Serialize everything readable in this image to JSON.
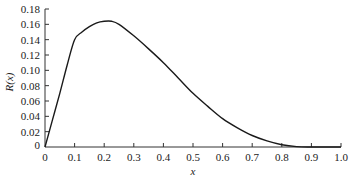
{
  "chart_data": {
    "type": "line",
    "title": "",
    "xlabel": "x",
    "ylabel": "R(x)",
    "xlim": [
      0,
      1.0
    ],
    "ylim": [
      0,
      0.18
    ],
    "grid": false,
    "legend": null,
    "x_ticks": [
      "0",
      "0.1",
      "0.2",
      "0.3",
      "0.4",
      "0.5",
      "0.6",
      "0.7",
      "0.8",
      "0.9",
      "1.0"
    ],
    "y_ticks": [
      "0",
      "0.02",
      "0.04",
      "0.06",
      "0.08",
      "0.10",
      "0.12",
      "0.14",
      "0.16",
      "0.18"
    ],
    "series": [
      {
        "name": "R(x)",
        "color": "#1a1a1a",
        "x": [
          0,
          0.025,
          0.05,
          0.075,
          0.1,
          0.125,
          0.15,
          0.175,
          0.2,
          0.225,
          0.25,
          0.3,
          0.35,
          0.4,
          0.45,
          0.5,
          0.55,
          0.6,
          0.65,
          0.7,
          0.75,
          0.8,
          0.85,
          0.9,
          1.0
        ],
        "values": [
          0,
          0.035,
          0.07,
          0.107,
          0.14,
          0.15,
          0.157,
          0.162,
          0.164,
          0.164,
          0.16,
          0.145,
          0.128,
          0.11,
          0.09,
          0.07,
          0.053,
          0.037,
          0.025,
          0.015,
          0.008,
          0.003,
          0.0005,
          0,
          0
        ]
      }
    ]
  }
}
